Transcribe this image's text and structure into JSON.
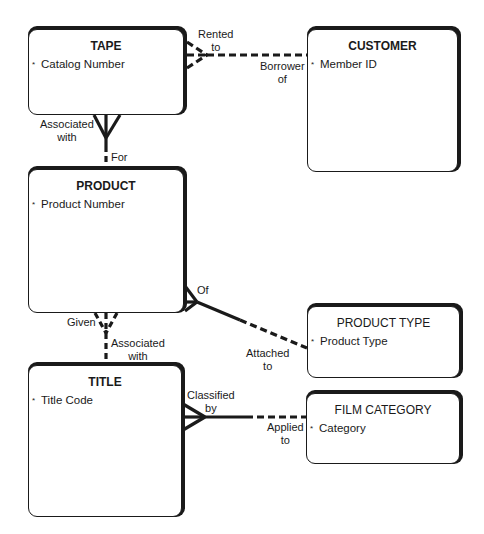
{
  "entities": {
    "tape": {
      "name": "TAPE",
      "attributes": [
        {
          "marker": "*",
          "label": "Catalog Number"
        }
      ]
    },
    "customer": {
      "name": "CUSTOMER",
      "attributes": [
        {
          "marker": "*",
          "label": "Member ID"
        }
      ]
    },
    "product": {
      "name": "PRODUCT",
      "attributes": [
        {
          "marker": "*",
          "label": "Product Number"
        }
      ]
    },
    "product_type": {
      "name": "PRODUCT TYPE",
      "attributes": [
        {
          "marker": "*",
          "label": "Product Type"
        }
      ]
    },
    "title": {
      "name": "TITLE",
      "attributes": [
        {
          "marker": "*",
          "label": "Title Code"
        }
      ]
    },
    "film_category": {
      "name": "FILM CATEGORY",
      "attributes": [
        {
          "marker": "*",
          "label": "Category"
        }
      ]
    }
  },
  "relationships": {
    "tape_customer": {
      "from_label": "Rented to",
      "to_label": "Borrower of",
      "from_line1": "Rented",
      "from_line2": "to",
      "to_line1": "Borrower",
      "to_line2": "of"
    },
    "tape_product": {
      "from_line1": "Associated",
      "from_line2": "with",
      "to_label": "For"
    },
    "product_product_type": {
      "from_label": "Of",
      "to_line1": "Attached",
      "to_line2": "to"
    },
    "product_title": {
      "from_label": "Given",
      "to_line1": "Associated",
      "to_line2": "with"
    },
    "title_film_category": {
      "from_line1": "Classified",
      "from_line2": "by",
      "to_line1": "Applied",
      "to_line2": "to"
    }
  },
  "colors": {
    "line": "#1a1a1a",
    "background": "#ffffff"
  }
}
